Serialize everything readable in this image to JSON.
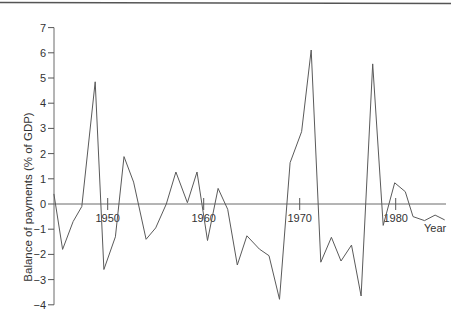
{
  "chart_data": {
    "type": "line",
    "title": "",
    "xlabel": "Year",
    "ylabel": "Balance of payments (% of GDP)",
    "ylim": [
      -4,
      7
    ],
    "xlim": [
      1944.4,
      1985.1
    ],
    "grid": false,
    "legend": null,
    "y_ticks": [
      7,
      6,
      5,
      4,
      3,
      2,
      1,
      0,
      -1,
      -2,
      -3,
      -4
    ],
    "y_tick_labels": [
      "7",
      "6",
      "5",
      "4",
      "3",
      "2",
      "1",
      "0",
      "−1",
      "−2",
      "−3",
      "−4"
    ],
    "x_ticks": [
      1950,
      1960,
      1970,
      1980
    ],
    "x_tick_labels": [
      "1950",
      "1960",
      "1970",
      "1980"
    ],
    "series": [
      {
        "name": "Balance of payments",
        "x": [
          1944.4,
          1945.3,
          1946.4,
          1947.3,
          1948.7,
          1949.6,
          1950.8,
          1951.7,
          1952.7,
          1954.0,
          1955.0,
          1956.1,
          1957.1,
          1958.3,
          1959.3,
          1960.4,
          1961.5,
          1962.5,
          1963.5,
          1964.5,
          1965.8,
          1966.8,
          1967.9,
          1969.0,
          1970.2,
          1971.2,
          1972.2,
          1973.3,
          1974.3,
          1975.4,
          1976.4,
          1977.6,
          1978.7,
          1979.9,
          1981.0,
          1981.8,
          1983.0,
          1984.1,
          1985.1
        ],
        "values": [
          0.4,
          -1.8,
          -0.7,
          -0.1,
          4.85,
          -2.6,
          -1.3,
          1.88,
          0.87,
          -1.4,
          -0.95,
          0.0,
          1.27,
          0.05,
          1.27,
          -1.45,
          0.62,
          -0.21,
          -2.42,
          -1.26,
          -1.79,
          -2.05,
          -3.78,
          1.64,
          2.87,
          6.11,
          -2.31,
          -1.32,
          -2.26,
          -1.63,
          -3.65,
          5.56,
          -0.85,
          0.84,
          0.49,
          -0.5,
          -0.66,
          -0.44,
          -0.63
        ]
      }
    ]
  },
  "layout": {
    "plot_left": 54,
    "y_zero_px": 204,
    "px_per_unit_y": 25.2,
    "x_1950_px": 107.7,
    "px_per_year": 9.6,
    "x_axis_end_px": 446,
    "colors": {
      "line": "#5a5a5a",
      "axis": "#6a6a6a",
      "text": "#333333"
    }
  }
}
